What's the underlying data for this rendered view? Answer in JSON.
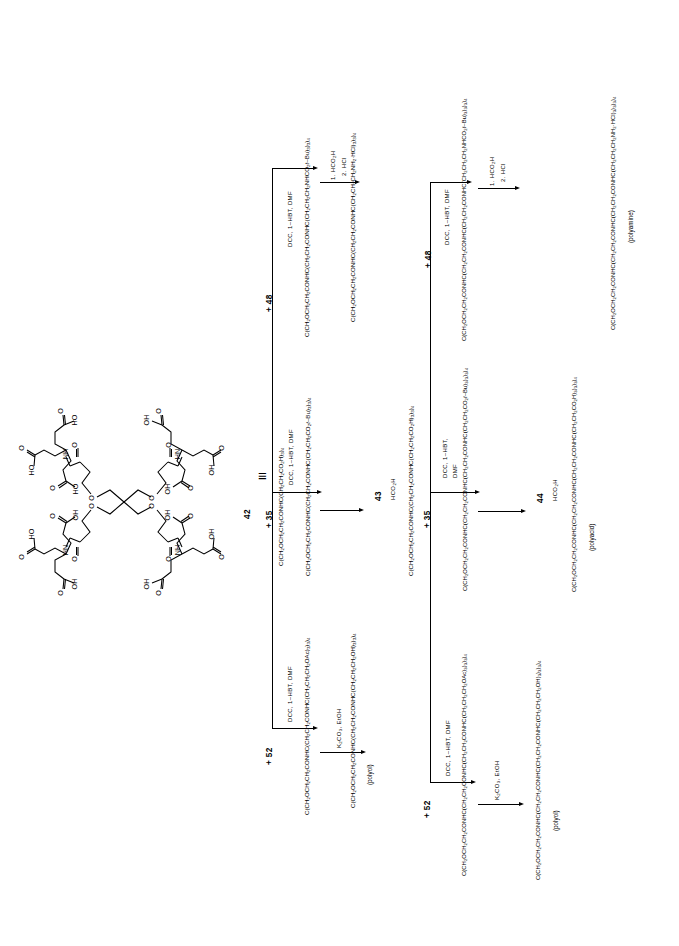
{
  "scheme": {
    "identity_symbol": "≡",
    "core_label": "42",
    "structure_atom_labels": [
      "OH",
      "O",
      "HN",
      "NH",
      "HO",
      "O",
      "OH"
    ],
    "structure_name": "tetra-acid-dendrimer-core-structure"
  },
  "labels": {
    "compound_42": "42",
    "compound_43": "43",
    "compound_44": "44",
    "polyacid": "(polyacid)",
    "polyamine": "(polyamine)",
    "polyol": "(polyol)"
  },
  "reagents": {
    "plus_35": "+ 35",
    "plus_48": "+ 48",
    "plus_52": "+ 52",
    "dcc_hbt_dmf": "DCC, 1–HBT, DMF",
    "dcc_hbt_dmf_2line_a": "DCC, 1–HBT,",
    "dcc_hbt_dmf_2line_b": "DMF",
    "hco2h": "HCO<sub>2</sub>H",
    "step1_hco2h": "1. HCO<sub>2</sub>H",
    "step2_hcl": "2. HCl",
    "k2co3_etoh": "K<sub>2</sub>CO<sub>3</sub>, EtOH"
  },
  "formulas": {
    "gen1_acid": "C(CH<sub>2</sub>OCH<sub>2</sub>CH<sub>2</sub>CONHC(CH<sub>2</sub>CH<sub>2</sub>CO<sub>2</sub>H)<sub>3</sub>)<sub>4</sub>",
    "gen2_tbu_ester": "C(CH<sub>2</sub>OCH<sub>2</sub>CH<sub>2</sub>CONHC(CH<sub>2</sub>CH<sub>2</sub>CONHC(CH<sub>2</sub>CH<sub>2</sub>CO<sub>2</sub><i>t</i>–Bu)<sub>3</sub>)<sub>3</sub>)<sub>4</sub>",
    "gen2_acid": "C(CH<sub>2</sub>OCH<sub>2</sub>CH<sub>2</sub>CONHC(CH<sub>2</sub>CH<sub>2</sub>CONHC(CH<sub>2</sub>CH<sub>2</sub>CO<sub>2</sub>H)<sub>3</sub>)<sub>3</sub>)<sub>4</sub>",
    "gen3_tbu_ester": "C(CH<sub>2</sub>OCH<sub>2</sub>CH<sub>2</sub>CONHC(CH<sub>2</sub>CH<sub>2</sub>CONHC(CH<sub>2</sub>CH<sub>2</sub>CONHC(CH<sub>2</sub>CH<sub>2</sub>CO<sub>2</sub><i>t</i>–Bu)<sub>3</sub>)<sub>3</sub>)<sub>3</sub>)<sub>4</sub>",
    "gen3_acid": "C(CH<sub>2</sub>OCH<sub>2</sub>CH<sub>2</sub>CONHC(CH<sub>2</sub>CH<sub>2</sub>CONHC(CH<sub>2</sub>CH<sub>2</sub>CONHC(CH<sub>2</sub>CH<sub>2</sub>CO<sub>2</sub>H)<sub>3</sub>)<sub>3</sub>)<sub>3</sub>)<sub>4</sub>",
    "gen2_boc_amine": "C(CH<sub>2</sub>OCH<sub>2</sub>CH<sub>2</sub>CONHC(CH<sub>2</sub>CH<sub>2</sub>CONHC(CH<sub>2</sub>CH<sub>2</sub>CH<sub>2</sub>NHCO<sub>2</sub><i>t</i>–Bu)<sub>3</sub>)<sub>3</sub>)<sub>4</sub>",
    "gen2_amine_hcl": "C(CH<sub>2</sub>OCH<sub>2</sub>CH<sub>2</sub>CONHC(CH<sub>2</sub>CH<sub>2</sub>CONHC(CH<sub>2</sub>CH<sub>2</sub>CH<sub>2</sub>NH<sub>2</sub>·HCl)<sub>3</sub>)<sub>3</sub>)<sub>4</sub>",
    "gen3_boc_amine": "C(CH<sub>2</sub>OCH<sub>2</sub>CH<sub>2</sub>CONHC(CH<sub>2</sub>CH<sub>2</sub>CONHC(CH<sub>2</sub>CH<sub>2</sub>CONHC(CH<sub>2</sub>CH<sub>2</sub>CH<sub>2</sub>NHCO<sub>2</sub><i>t</i>–Bu)<sub>3</sub>)<sub>3</sub>)<sub>3</sub>)<sub>4</sub>",
    "gen3_amine_hcl": "C(CH<sub>2</sub>OCH<sub>2</sub>CH<sub>2</sub>CONHC(CH<sub>2</sub>CH<sub>2</sub>CONHC(CH<sub>2</sub>CH<sub>2</sub>CONHC(CH<sub>2</sub>CH<sub>2</sub>CH<sub>2</sub>NH<sub>2</sub>·HCl)<sub>3</sub>)<sub>3</sub>)<sub>3</sub>)<sub>4</sub>",
    "gen2_acetate": "C(CH<sub>2</sub>OCH<sub>2</sub>CH<sub>2</sub>CONHC(CH<sub>2</sub>CH<sub>2</sub>CONHC(CH<sub>2</sub>CH<sub>2</sub>CH<sub>2</sub>OAc)<sub>3</sub>)<sub>3</sub>)<sub>4</sub>",
    "gen2_alcohol": "C(CH<sub>2</sub>OCH<sub>2</sub>CH<sub>2</sub>CONHC(CH<sub>2</sub>CH<sub>2</sub>CONHC(CH<sub>2</sub>CH<sub>2</sub>CH<sub>2</sub>OH)<sub>3</sub>)<sub>3</sub>)<sub>4</sub>",
    "gen3_acetate": "C(CH<sub>2</sub>OCH<sub>2</sub>CH<sub>2</sub>CONHC(CH<sub>2</sub>CH<sub>2</sub>CONHC(CH<sub>2</sub>CH<sub>2</sub>CONHC(CH<sub>2</sub>CH<sub>2</sub>CH<sub>2</sub>OAc)<sub>3</sub>)<sub>3</sub>)<sub>3</sub>)<sub>4</sub>",
    "gen3_alcohol": "C(CH<sub>2</sub>OCH<sub>2</sub>CH<sub>2</sub>CONHC(CH<sub>2</sub>CH<sub>2</sub>CONHC(CH<sub>2</sub>CH<sub>2</sub>CONHC(CH<sub>2</sub>CH<sub>2</sub>CH<sub>2</sub>OH)<sub>3</sub>)<sub>3</sub>)<sub>3</sub>)<sub>4</sub>"
  }
}
